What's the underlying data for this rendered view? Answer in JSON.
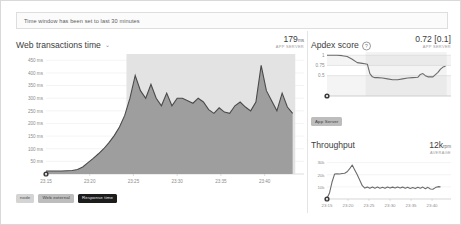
{
  "banner": {
    "text": "Time window has been set to last 30 minutes"
  },
  "main_panel": {
    "title": "Web transactions time",
    "chevron": "⌄",
    "value": "179",
    "unit": "ms",
    "sub": "APP SERVER",
    "legend": [
      {
        "label": "node",
        "style": "light"
      },
      {
        "label": "Web external",
        "style": "mid"
      },
      {
        "label": "Response time",
        "style": "dark"
      }
    ]
  },
  "apdex_panel": {
    "title": "Apdex score",
    "help_icon": "?",
    "value": "0.72 [0.1]",
    "sub": "APP SERVER",
    "legend": [
      {
        "label": "App Server",
        "style": "mid"
      }
    ]
  },
  "throughput_panel": {
    "title": "Throughput",
    "value": "12k",
    "unit": "rpm",
    "sub": "AVERAGE"
  },
  "colors": {
    "area_fill": "#9e9e9e",
    "area_line": "#4a4a4a",
    "selection": "#e3e3e3",
    "grid": "#ececec",
    "axis_text": "#8c8c8c",
    "line": "#6b6b6b"
  },
  "chart_data": [
    {
      "id": "web_transactions_time",
      "type": "area",
      "title": "Web transactions time",
      "xlabel": "",
      "ylabel": "ms",
      "ylim": [
        0,
        475
      ],
      "ytick_labels": [
        "50 ms",
        "100 ms",
        "150 ms",
        "200 ms",
        "250 ms",
        "300 ms",
        "350 ms",
        "400 ms",
        "450 ms"
      ],
      "yticks": [
        50,
        100,
        150,
        200,
        250,
        300,
        350,
        400,
        450
      ],
      "xtick_labels": [
        "23:15",
        "23:20",
        "23:25",
        "23:30",
        "23:35",
        "23:40"
      ],
      "xticks": [
        0,
        5,
        10,
        15,
        20,
        25
      ],
      "grid": true,
      "legend_position": "bottom-left",
      "selection_span": [
        9.2,
        28.5
      ],
      "x": [
        0,
        0.6,
        1.2,
        1.8,
        2.4,
        3.0,
        3.6,
        4.2,
        4.8,
        5.4,
        6.0,
        6.6,
        7.2,
        7.8,
        8.4,
        9.0,
        9.6,
        10.2,
        10.8,
        11.4,
        12.0,
        12.6,
        13.2,
        13.8,
        14.4,
        15.0,
        15.6,
        16.2,
        16.8,
        17.4,
        18.0,
        18.6,
        19.2,
        19.8,
        20.4,
        21.0,
        21.6,
        22.2,
        22.8,
        23.4,
        24.0,
        24.6,
        25.2,
        25.8,
        26.4,
        27.0,
        27.6,
        28.2
      ],
      "series": [
        {
          "name": "Response time",
          "values": [
            12,
            12,
            12,
            12,
            13,
            14,
            18,
            28,
            45,
            62,
            80,
            100,
            124,
            152,
            186,
            232,
            300,
            390,
            330,
            300,
            355,
            300,
            270,
            320,
            270,
            300,
            300,
            290,
            280,
            300,
            285,
            255,
            240,
            262,
            245,
            240,
            270,
            285,
            265,
            250,
            285,
            430,
            330,
            290,
            250,
            320,
            265,
            240
          ]
        }
      ]
    },
    {
      "id": "apdex_score",
      "type": "line",
      "title": "Apdex score",
      "ylim": [
        0,
        1.08
      ],
      "ytick_labels": [
        "0",
        "0.5",
        "0.75",
        "1"
      ],
      "yticks": [
        0,
        0.5,
        0.75,
        1
      ],
      "grid": true,
      "selection_span": [
        9.2,
        28.5
      ],
      "x": [
        0,
        1.2,
        2.4,
        3.6,
        4.8,
        6.0,
        7.2,
        8.4,
        9.0,
        9.6,
        10.2,
        10.8,
        11.4,
        12.0,
        13.2,
        14.4,
        15.6,
        16.8,
        18.0,
        19.2,
        20.4,
        21.6,
        22.2,
        22.8,
        23.4,
        24.0,
        25.2,
        26.4,
        27.0,
        27.6,
        28.2
      ],
      "series": [
        {
          "name": "App Server",
          "values": [
            1.0,
            1.0,
            1.0,
            0.99,
            0.97,
            0.9,
            0.82,
            0.8,
            0.79,
            0.78,
            0.55,
            0.47,
            0.45,
            0.45,
            0.44,
            0.42,
            0.4,
            0.4,
            0.42,
            0.44,
            0.45,
            0.46,
            0.53,
            0.55,
            0.5,
            0.47,
            0.47,
            0.58,
            0.66,
            0.71,
            0.73
          ]
        }
      ]
    },
    {
      "id": "throughput",
      "type": "line",
      "title": "Throughput",
      "ylabel": "rpm",
      "ylim": [
        0,
        33000
      ],
      "ytick_labels": [
        "0",
        "10k",
        "20k",
        "30k"
      ],
      "yticks": [
        0,
        10000,
        20000,
        30000
      ],
      "xtick_labels": [
        "23:15",
        "23:20",
        "23:25",
        "23:30",
        "23:35",
        "23:40"
      ],
      "xticks": [
        0,
        5,
        10,
        15,
        20,
        25
      ],
      "grid": true,
      "x": [
        0,
        0.6,
        1.2,
        1.8,
        2.4,
        3.0,
        3.6,
        4.2,
        4.8,
        5.4,
        6.0,
        6.6,
        7.2,
        7.8,
        8.4,
        9.0,
        9.6,
        10.2,
        10.8,
        11.4,
        12.0,
        12.6,
        13.2,
        13.8,
        14.4,
        15.0,
        15.6,
        16.2,
        16.8,
        17.4,
        18.0,
        18.6,
        19.2,
        19.8,
        20.4,
        21.0,
        21.6,
        22.2,
        22.8,
        23.4,
        24.0,
        24.6,
        25.2,
        25.8,
        26.4,
        27.0
      ],
      "series": [
        {
          "name": "Throughput",
          "values": [
            600,
            5000,
            14000,
            20500,
            20800,
            20600,
            21000,
            21200,
            22500,
            25000,
            28000,
            24000,
            20000,
            15500,
            11000,
            9000,
            9800,
            8800,
            9900,
            8900,
            9800,
            8900,
            9700,
            8800,
            9900,
            9000,
            9800,
            9000,
            9900,
            9100,
            9800,
            8800,
            9600,
            8700,
            9500,
            8600,
            9700,
            8900,
            9800,
            8500,
            9600,
            8200,
            8000,
            9400,
            10200,
            10000
          ]
        }
      ]
    }
  ]
}
